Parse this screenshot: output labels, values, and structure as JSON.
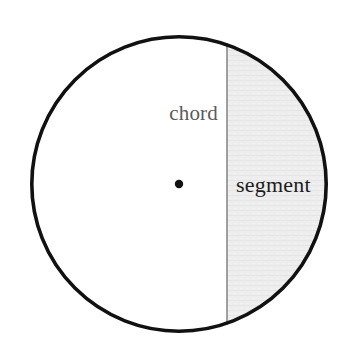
{
  "figure": {
    "type": "geometry-diagram",
    "background_color": "#ffffff",
    "width": 349,
    "height": 353
  },
  "chart_data": {
    "type": "diagram",
    "title": "",
    "shapes": [
      {
        "name": "circle",
        "kind": "circle",
        "cx": 179,
        "cy": 184,
        "r": 149,
        "stroke": "#111111",
        "stroke_width": 3.6,
        "fill": "#ffffff"
      },
      {
        "name": "center-point",
        "kind": "point",
        "cx": 179,
        "cy": 184,
        "r": 4.2,
        "fill": "#111111"
      },
      {
        "name": "chord",
        "kind": "line",
        "x1": 227,
        "y1": 43,
        "x2": 227,
        "y2": 325,
        "stroke": "#8a8a8a",
        "stroke_width": 1.6
      },
      {
        "name": "segment",
        "kind": "circular-segment",
        "chord_x": 227,
        "side": "right",
        "fill": "#ededed",
        "stroke": "none"
      }
    ],
    "annotations": [
      {
        "name": "chord",
        "text": "chord",
        "x": 218,
        "y": 120,
        "anchor": "end",
        "color": "#5a5a5a",
        "font_size": 21
      },
      {
        "name": "segment",
        "text": "segment",
        "x": 236,
        "y": 192,
        "anchor": "start",
        "color": "#1c1c1c",
        "font_size": 22
      }
    ]
  },
  "labels": {
    "chord": "chord",
    "segment": "segment"
  },
  "colors": {
    "outline": "#111111",
    "chord_line": "#8a8a8a",
    "segment_fill": "#ededed",
    "chord_text": "#5a5a5a",
    "segment_text": "#1c1c1c",
    "background": "#ffffff"
  }
}
